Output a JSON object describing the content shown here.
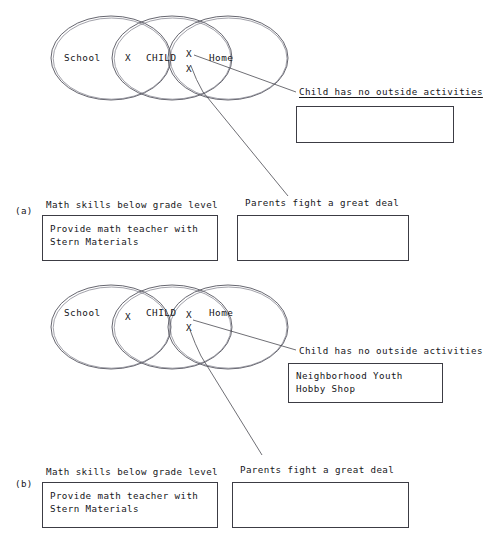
{
  "figure": {
    "panels": [
      {
        "id": "a",
        "panel_label": "(a)",
        "venn": {
          "circles": [
            {
              "name": "school-circle",
              "label": "School"
            },
            {
              "name": "child-circle",
              "label": "CHILD"
            },
            {
              "name": "home-circle",
              "label": "Home"
            }
          ],
          "x_marks": [
            {
              "name": "x-mark-school-child",
              "label": "X"
            },
            {
              "name": "x-mark-child-home-upper",
              "label": "X"
            },
            {
              "name": "x-mark-child-home-lower",
              "label": "X"
            }
          ]
        },
        "annotations": [
          {
            "name": "annotation-outside-activities",
            "caption": "Child has no outside activities",
            "underlined": true,
            "box_text": ""
          },
          {
            "name": "annotation-parents-fight",
            "caption": "Parents fight a great deal",
            "underlined": false,
            "box_text": ""
          },
          {
            "name": "annotation-math-skills",
            "caption": "Math skills below grade level",
            "underlined": false,
            "box_text": "Provide math teacher with\nStern Materials"
          }
        ]
      },
      {
        "id": "b",
        "panel_label": "(b)",
        "venn": {
          "circles": [
            {
              "name": "school-circle",
              "label": "School"
            },
            {
              "name": "child-circle",
              "label": "CHILD"
            },
            {
              "name": "home-circle",
              "label": "Home"
            }
          ],
          "x_marks": [
            {
              "name": "x-mark-school-child",
              "label": "X"
            },
            {
              "name": "x-mark-child-home-upper",
              "label": "X"
            },
            {
              "name": "x-mark-child-home-lower",
              "label": "X"
            }
          ]
        },
        "annotations": [
          {
            "name": "annotation-outside-activities",
            "caption": "Child has no outside activities",
            "underlined": false,
            "box_text": "Neighborhood Youth\nHobby Shop"
          },
          {
            "name": "annotation-parents-fight",
            "caption": "Parents fight a great deal",
            "underlined": false,
            "box_text": ""
          },
          {
            "name": "annotation-math-skills",
            "caption": "Math skills below grade level",
            "underlined": false,
            "box_text": "Provide math teacher with\nStern Materials"
          }
        ]
      }
    ]
  },
  "colors": {
    "ink": "#16161a",
    "rule": "#3c3c44",
    "circle_stroke": "#55555f",
    "background": "#ffffff"
  }
}
